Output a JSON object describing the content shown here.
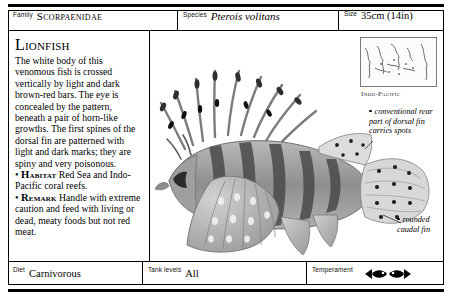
{
  "header": {
    "family_label": "Family",
    "family_value": "Scorpaenidae",
    "species_label": "Species",
    "species_value": "Pterois volitans",
    "size_label": "Size",
    "size_value": "35cm (14in)"
  },
  "main": {
    "title": "Lionfish",
    "description": "The white body of this venomous fish is crossed vertically by light and dark brown-red bars. The eye is concealed by the pattern, beneath a pair of horn-like growths. The first spines of the dorsal fin are patterned with light and dark marks; they are spiny and very poisonous.",
    "habitat_keyword": "Habitat",
    "habitat_text": "Red Sea and Indo-Pacific coral reefs.",
    "remark_keyword": "Remark",
    "remark_text": "Handle with extreme caution and feed with living or dead, meaty foods but not red meat.",
    "bullet_char": "•"
  },
  "map": {
    "caption": "Indo-Pacific"
  },
  "callouts": [
    "conventional rear part of dorsal fin carries spots",
    "rounded caudal fin"
  ],
  "footer": {
    "diet_label": "Diet",
    "diet_value": "Carnivorous",
    "tank_label": "Tank levels",
    "tank_value": "All",
    "temperament_label": "Temperament",
    "temperament_icon": "two-fish-facing-icon"
  },
  "colors": {
    "ink": "#000000",
    "rule": "#000000",
    "paper": "#ffffff",
    "illustration_dark": "#4a4a4a",
    "illustration_mid": "#8d8d8d",
    "illustration_light": "#c9c9c9"
  }
}
